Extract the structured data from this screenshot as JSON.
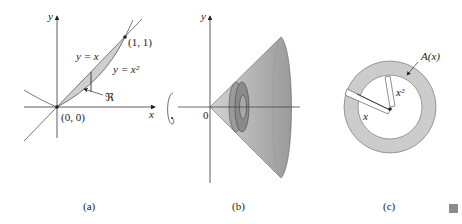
{
  "figure": {
    "panels": [
      {
        "id": "a",
        "caption": "(a)",
        "axis_x_label": "x",
        "axis_y_label": "y",
        "curve_line_label": "y = x",
        "curve_parabola_label": "y = x²",
        "point_upper_label": "(1, 1)",
        "point_origin_label": "(0, 0)",
        "region_label": "ℜ"
      },
      {
        "id": "b",
        "caption": "(b)",
        "axis_y_label": "y",
        "axis_x_label": "x",
        "origin_label": "0",
        "rotation_symbol": "rotation-arrow"
      },
      {
        "id": "c",
        "caption": "(c)",
        "area_label": "A(x)",
        "outer_radius_label": "x",
        "inner_radius_label": "x²"
      }
    ],
    "colors": {
      "region_fill": "#cfcfcf",
      "solid_fill": "#b8b8b8",
      "washer_fill": "#8f8f8f",
      "ring_fill": "#cccccc",
      "stroke": "#333333"
    }
  }
}
